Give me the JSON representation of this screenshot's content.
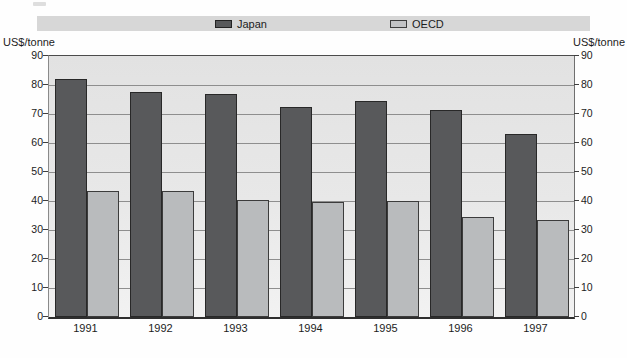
{
  "axes": {
    "left_unit_label": "US$/tonne",
    "right_unit_label": "US$/tonne"
  },
  "chart_data": {
    "type": "bar",
    "title": "",
    "categories": [
      "1991",
      "1992",
      "1993",
      "1994",
      "1995",
      "1996",
      "1997"
    ],
    "series": [
      {
        "name": "Japan",
        "color": "#58595b",
        "values": [
          82,
          77.5,
          77,
          72.5,
          74.5,
          71.5,
          63
        ]
      },
      {
        "name": "OECD",
        "color": "#b9bbbd",
        "values": [
          43.5,
          43.5,
          40.5,
          39.5,
          40,
          34.5,
          33.5
        ]
      }
    ],
    "xlabel": "",
    "ylabel_left": "US$/tonne",
    "ylabel_right": "US$/tonne",
    "ylim": [
      0,
      90
    ],
    "yticks": [
      0,
      10,
      20,
      30,
      40,
      50,
      60,
      70,
      80,
      90
    ],
    "grid": true,
    "legend_position": "top",
    "legend_background": "#d7d7d7",
    "plot_background": "#e6e6e6",
    "gridline_color": "#8e8e8e"
  }
}
